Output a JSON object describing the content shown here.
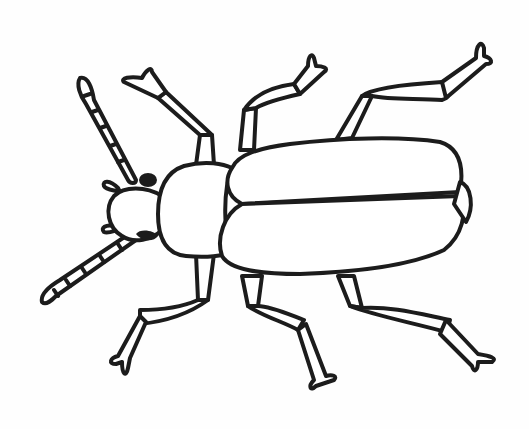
{
  "image": {
    "title": "Beetle line drawing",
    "subject": "beetle",
    "style": "black outline illustration on white background",
    "parts": [
      "antennae",
      "head",
      "eyes",
      "mandibles",
      "pronotum",
      "elytra",
      "legs"
    ],
    "leg_count": 6,
    "antenna_count": 2,
    "colors": {
      "ink": "#1c1c1c",
      "background": "#fefefe"
    }
  }
}
